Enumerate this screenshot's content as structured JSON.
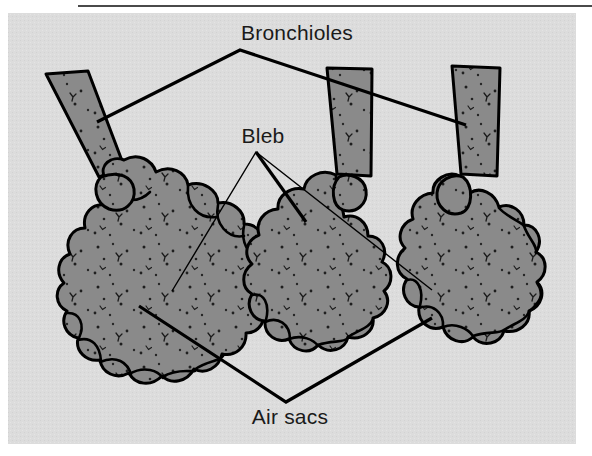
{
  "figure": {
    "background_color": "#ffffff",
    "panel_color": "#dcdcdc",
    "tissue_fill": "#8a8a8a",
    "tube_fill": "#8a8a8a",
    "outline_color": "#000000",
    "rule_color": "#4a4a4a",
    "text_color": "#1a1a1a"
  },
  "labels": {
    "bronchioles": "Bronchioles",
    "bleb": "Bleb",
    "air_sacs": "Air sacs"
  },
  "annotations": [
    {
      "id": "bronchioles",
      "text": "Bronchioles",
      "text_x": 297,
      "text_y": 40,
      "apex_x": 240,
      "apex_y": 50,
      "leader_weight": "thick",
      "targets": [
        {
          "x": 97,
          "y": 122
        },
        {
          "x": 466,
          "y": 125
        }
      ]
    },
    {
      "id": "bleb",
      "text": "Bleb",
      "text_x": 263,
      "text_y": 143,
      "apex_x": 256,
      "apex_y": 152,
      "leader_weight": "thin",
      "targets": [
        {
          "x": 172,
          "y": 291
        },
        {
          "x": 432,
          "y": 290
        }
      ]
    },
    {
      "id": "air-sacs",
      "text": "Air sacs",
      "text_x": 290,
      "text_y": 424,
      "apex_x": 286,
      "apex_y": 402,
      "leader_weight": "thick",
      "targets": [
        {
          "x": 139,
          "y": 306
        },
        {
          "x": 432,
          "y": 318
        }
      ]
    }
  ],
  "structures": {
    "bronchiole_tubes": [
      {
        "id": "tube-left",
        "orientation": "diagonal",
        "top_x": 46,
        "top_y": 74
      },
      {
        "id": "tube-middle",
        "orientation": "vertical",
        "top_x": 327,
        "top_y": 68
      },
      {
        "id": "tube-right",
        "orientation": "vertical",
        "top_x": 452,
        "top_y": 66
      }
    ],
    "alveolar_clusters": [
      {
        "id": "cluster-left",
        "center_x": 145,
        "center_y": 272
      },
      {
        "id": "cluster-middle",
        "center_x": 320,
        "center_y": 265
      },
      {
        "id": "cluster-right",
        "center_x": 455,
        "center_y": 290
      }
    ],
    "blebs": [
      {
        "id": "bleb-left",
        "center_x": 121,
        "center_y": 178
      },
      {
        "id": "bleb-middle",
        "center_x": 355,
        "center_y": 188
      },
      {
        "id": "bleb-right",
        "center_x": 440,
        "center_y": 185
      }
    ]
  },
  "panel": {
    "x": 8,
    "y": 13,
    "width": 568,
    "height": 431
  },
  "top_rule": {
    "x1": 78,
    "x2": 592,
    "y": 6,
    "thickness": 2
  }
}
